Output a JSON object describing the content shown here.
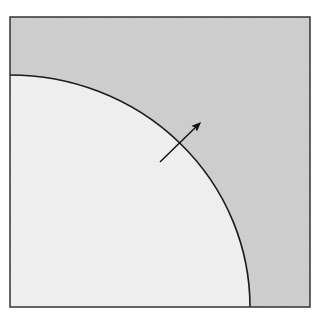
{
  "diagram": {
    "colors": {
      "outer_region": "#cfcfcf",
      "inner_region": "#efefef",
      "boundary": "#1a1a1a",
      "frame": "#333333",
      "arrow": "#111111"
    },
    "elements": [
      {
        "name": "square-frame"
      },
      {
        "name": "outer-region"
      },
      {
        "name": "inner-quarter-disk"
      },
      {
        "name": "arc-boundary"
      },
      {
        "name": "normal-arrow"
      }
    ]
  }
}
